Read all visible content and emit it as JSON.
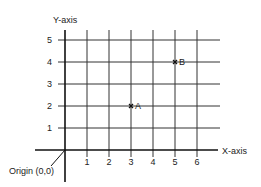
{
  "chart_data": {
    "type": "scatter",
    "title": "",
    "xlabel": "X-axis",
    "ylabel": "Y-axis",
    "xlim": [
      0,
      6.7
    ],
    "ylim": [
      0,
      5.3
    ],
    "x_ticks": [
      1,
      2,
      3,
      4,
      5,
      6
    ],
    "y_ticks": [
      1,
      2,
      3,
      4,
      5
    ],
    "grid": true,
    "points": [
      {
        "label": "A",
        "x": 3,
        "y": 2
      },
      {
        "label": "B",
        "x": 5,
        "y": 4
      }
    ],
    "annotations": [
      {
        "text": "Origin (0,0)",
        "x": 0,
        "y": 0
      }
    ]
  }
}
